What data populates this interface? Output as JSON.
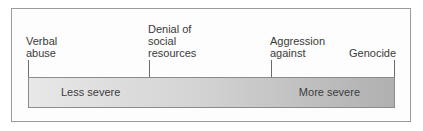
{
  "diagram": {
    "type": "severity-continuum",
    "points": [
      {
        "label_lines": [
          "Verbal",
          "abuse"
        ]
      },
      {
        "label_lines": [
          "Denial of",
          "social",
          "resources"
        ]
      },
      {
        "label_lines": [
          "Aggression",
          "against"
        ]
      },
      {
        "label_lines": [
          "Genocide"
        ]
      }
    ],
    "bar": {
      "left_label": "Less severe",
      "right_label": "More severe",
      "gradient_start": "#e8e8e8",
      "gradient_end": "#b0b0b0"
    }
  }
}
